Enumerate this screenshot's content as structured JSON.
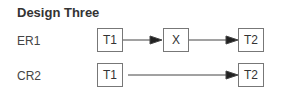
{
  "title": "Design Three",
  "rows": [
    {
      "label": "ER1",
      "nodes": [
        "T1",
        "X",
        "T2"
      ]
    },
    {
      "label": "CR2",
      "nodes": [
        "T1",
        "T2"
      ]
    }
  ]
}
